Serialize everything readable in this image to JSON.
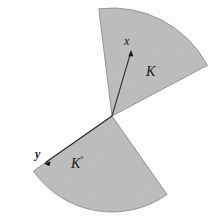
{
  "figure": {
    "type": "geometry-diagram",
    "background_color": "#fdfdfd",
    "sector_fill_color": "#bdbdbd",
    "sector_stroke_color": "#8a8a8a",
    "ray_color": "#2b2b2b",
    "apex": {
      "x": 112,
      "y": 116
    },
    "sectors": [
      {
        "name": "cone-K",
        "label": "K",
        "start_angle_deg": 97,
        "end_angle_deg": 28,
        "radius": 108
      },
      {
        "name": "polar-cone-K",
        "label": "K",
        "label_superscript": "°",
        "start_angle_deg": 215,
        "end_angle_deg": 305,
        "radius": 96
      }
    ],
    "points": [
      {
        "name": "point-x",
        "label": "x",
        "x": 131,
        "y": 51,
        "ray_from_apex": true
      },
      {
        "name": "point-y",
        "label": "y",
        "x": 45,
        "y": 163,
        "ray_from_apex": true
      }
    ],
    "labels": {
      "x": "x",
      "K": "K",
      "y": "y",
      "K_polar_base": "K",
      "K_polar_degree": "°"
    }
  }
}
